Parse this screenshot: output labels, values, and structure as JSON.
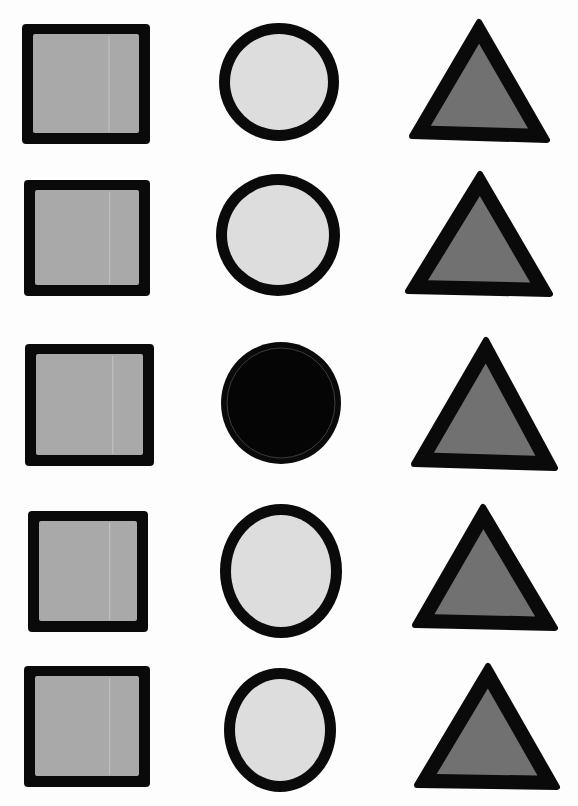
{
  "columns": [
    "square",
    "circle",
    "triangle"
  ],
  "colors": {
    "background": "#fdfdfd",
    "outline": "#0a0a0a",
    "square_fill": "#a9a9a9",
    "circle_fill": "#dddddd",
    "triangle_fill": "#717171",
    "odd_fill": "#050505"
  },
  "rows": [
    {
      "square": "gray",
      "circle": "light",
      "triangle": "dark"
    },
    {
      "square": "gray",
      "circle": "light",
      "triangle": "dark"
    },
    {
      "square": "gray",
      "circle": "black",
      "triangle": "dark"
    },
    {
      "square": "gray",
      "circle": "light",
      "triangle": "dark"
    },
    {
      "square": "gray",
      "circle": "light",
      "triangle": "dark"
    }
  ],
  "odd_one_out": {
    "row": 3,
    "shape": "circle",
    "fill": "black"
  }
}
